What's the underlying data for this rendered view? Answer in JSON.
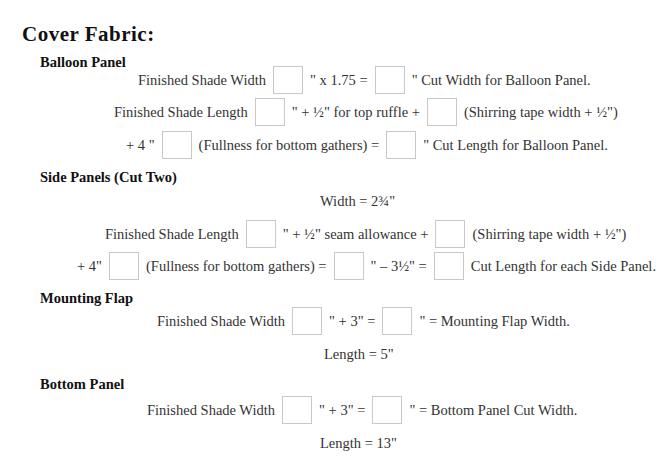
{
  "title": "Cover Fabric:",
  "sections": {
    "balloon": {
      "heading": "Balloon Panel",
      "l1": {
        "a": "Finished Shade Width",
        "b": "\" x 1.75 =",
        "c": "\" Cut Width for Balloon Panel."
      },
      "l2": {
        "a": "Finished Shade Length",
        "b": "\" + ½\" for top ruffle +",
        "c": "(Shirring tape width + ½\")"
      },
      "l3": {
        "a": "+ 4 \"",
        "b": "(Fullness for bottom gathers) =",
        "c": "\" Cut Length for Balloon Panel."
      }
    },
    "side": {
      "heading": "Side Panels (Cut Two)",
      "width": "Width = 2¾\"",
      "l1": {
        "a": "Finished Shade Length",
        "b": "\" + ½\" seam allowance +",
        "c": "(Shirring tape width + ½\")"
      },
      "l2": {
        "a": "+ 4\"",
        "b": "(Fullness for bottom gathers) =",
        "c": "\" – 3½\" =",
        "d": "Cut Length for each Side Panel."
      }
    },
    "mounting": {
      "heading": "Mounting Flap",
      "l1": {
        "a": "Finished Shade Width",
        "b": "\" + 3\" =",
        "c": "\" = Mounting Flap Width."
      },
      "length": "Length = 5\""
    },
    "bottom": {
      "heading": "Bottom Panel",
      "l1": {
        "a": "Finished Shade Width",
        "b": "\" + 3\"  =",
        "c": "\" = Bottom Panel Cut Width."
      },
      "length": "Length = 13\""
    }
  }
}
